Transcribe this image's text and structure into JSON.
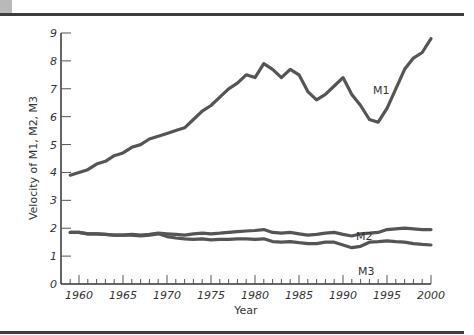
{
  "chart_data": {
    "type": "line",
    "title": "",
    "xlabel": "Year",
    "ylabel": "Velocity of M1, M2, M3",
    "xlim": [
      1958,
      2000
    ],
    "ylim": [
      0,
      9
    ],
    "grid": false,
    "legend": "inline-labels",
    "x_ticks": [
      1960,
      1965,
      1970,
      1975,
      1980,
      1985,
      1990,
      1995,
      2000
    ],
    "x_tick_labels": [
      "1960",
      "1965",
      "1970",
      "1975",
      "1980",
      "1985",
      "1990",
      "1995",
      "2000"
    ],
    "y_ticks": [
      0,
      1,
      2,
      3,
      4,
      5,
      6,
      7,
      8,
      9
    ],
    "y_tick_labels": [
      "0",
      "1",
      "2",
      "3",
      "4",
      "5",
      "6",
      "7",
      "8",
      "9"
    ],
    "x": [
      1959,
      1960,
      1961,
      1962,
      1963,
      1964,
      1965,
      1966,
      1967,
      1968,
      1969,
      1970,
      1971,
      1972,
      1973,
      1974,
      1975,
      1976,
      1977,
      1978,
      1979,
      1980,
      1981,
      1982,
      1983,
      1984,
      1985,
      1986,
      1987,
      1988,
      1989,
      1990,
      1991,
      1992,
      1993,
      1994,
      1995,
      1996,
      1997,
      1998,
      1999,
      2000
    ],
    "series": [
      {
        "name": "M1",
        "label": "M1",
        "color": "#555555",
        "values": [
          3.9,
          4.0,
          4.1,
          4.3,
          4.4,
          4.6,
          4.7,
          4.9,
          5.0,
          5.2,
          5.3,
          5.4,
          5.5,
          5.6,
          5.9,
          6.2,
          6.4,
          6.7,
          7.0,
          7.2,
          7.5,
          7.4,
          7.9,
          7.7,
          7.4,
          7.7,
          7.5,
          6.9,
          6.6,
          6.8,
          7.1,
          7.4,
          6.8,
          6.4,
          5.9,
          5.8,
          6.3,
          7.0,
          7.7,
          8.1,
          8.3,
          8.8
        ]
      },
      {
        "name": "M2",
        "label": "M2",
        "color": "#555555",
        "values": [
          1.85,
          1.85,
          1.8,
          1.8,
          1.78,
          1.75,
          1.75,
          1.78,
          1.75,
          1.78,
          1.82,
          1.8,
          1.78,
          1.75,
          1.8,
          1.82,
          1.8,
          1.82,
          1.85,
          1.88,
          1.9,
          1.92,
          1.95,
          1.85,
          1.82,
          1.85,
          1.8,
          1.75,
          1.78,
          1.82,
          1.85,
          1.78,
          1.72,
          1.8,
          1.82,
          1.85,
          1.95,
          1.98,
          2.0,
          1.98,
          1.95,
          1.95
        ]
      },
      {
        "name": "M3",
        "label": "M3",
        "color": "#555555",
        "values": [
          1.85,
          1.85,
          1.8,
          1.8,
          1.78,
          1.75,
          1.75,
          1.75,
          1.72,
          1.75,
          1.8,
          1.7,
          1.65,
          1.62,
          1.6,
          1.62,
          1.58,
          1.6,
          1.6,
          1.62,
          1.62,
          1.6,
          1.62,
          1.52,
          1.5,
          1.52,
          1.48,
          1.45,
          1.45,
          1.5,
          1.5,
          1.4,
          1.3,
          1.35,
          1.5,
          1.52,
          1.55,
          1.52,
          1.5,
          1.45,
          1.42,
          1.4
        ]
      }
    ]
  }
}
